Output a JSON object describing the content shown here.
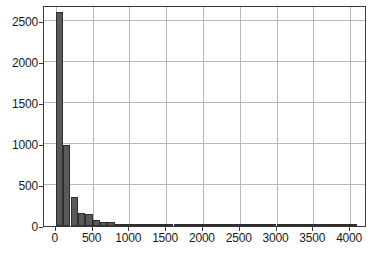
{
  "chart_data": {
    "type": "bar",
    "title": "",
    "subtitle": "",
    "xlabel": "",
    "ylabel": "",
    "xlim": [
      -160,
      4230
    ],
    "ylim": [
      0,
      2700
    ],
    "grid": true,
    "legend": null,
    "bin_width": 100,
    "xticks": [
      0,
      500,
      1000,
      1500,
      2000,
      2500,
      3000,
      3500,
      4000
    ],
    "xtick_labels": [
      "0",
      "500",
      "1000",
      "1500",
      "2000",
      "2500",
      "3000",
      "3500",
      "4000"
    ],
    "yticks": [
      0,
      500,
      1000,
      1500,
      2000,
      2500
    ],
    "ytick_labels": [
      "0",
      "500",
      "1000",
      "1500",
      "2000",
      "2500"
    ],
    "bar_color": "#595959",
    "bar_edge_color": "#2e2e2e",
    "grid_color": "#b9b9b9",
    "axis_color": "#3a3a3a",
    "bins": [
      {
        "x0": 0,
        "x1": 100,
        "value": 2620
      },
      {
        "x0": 100,
        "x1": 200,
        "value": 995
      },
      {
        "x0": 200,
        "x1": 300,
        "value": 350
      },
      {
        "x0": 300,
        "x1": 400,
        "value": 155
      },
      {
        "x0": 400,
        "x1": 500,
        "value": 150
      },
      {
        "x0": 500,
        "x1": 600,
        "value": 80
      },
      {
        "x0": 600,
        "x1": 700,
        "value": 55
      },
      {
        "x0": 700,
        "x1": 800,
        "value": 50
      },
      {
        "x0": 800,
        "x1": 900,
        "value": 22
      },
      {
        "x0": 900,
        "x1": 1000,
        "value": 12
      },
      {
        "x0": 1000,
        "x1": 1100,
        "value": 8
      },
      {
        "x0": 1100,
        "x1": 1200,
        "value": 6
      },
      {
        "x0": 1200,
        "x1": 1300,
        "value": 5
      },
      {
        "x0": 1300,
        "x1": 1400,
        "value": 5
      },
      {
        "x0": 1400,
        "x1": 1500,
        "value": 4
      },
      {
        "x0": 1500,
        "x1": 1600,
        "value": 4
      },
      {
        "x0": 1600,
        "x1": 1700,
        "value": 4
      },
      {
        "x0": 1700,
        "x1": 1800,
        "value": 4
      },
      {
        "x0": 1800,
        "x1": 1900,
        "value": 12
      },
      {
        "x0": 1900,
        "x1": 2000,
        "value": 4
      },
      {
        "x0": 2000,
        "x1": 2100,
        "value": 3
      },
      {
        "x0": 2100,
        "x1": 2200,
        "value": 18
      },
      {
        "x0": 2200,
        "x1": 2300,
        "value": 18
      },
      {
        "x0": 2300,
        "x1": 2400,
        "value": 3
      },
      {
        "x0": 2400,
        "x1": 2500,
        "value": 3
      },
      {
        "x0": 2500,
        "x1": 2600,
        "value": 2
      },
      {
        "x0": 2600,
        "x1": 2700,
        "value": 2
      },
      {
        "x0": 2700,
        "x1": 2800,
        "value": 2
      },
      {
        "x0": 2800,
        "x1": 2900,
        "value": 2
      },
      {
        "x0": 2900,
        "x1": 3000,
        "value": 2
      },
      {
        "x0": 3000,
        "x1": 3100,
        "value": 2
      },
      {
        "x0": 3100,
        "x1": 3200,
        "value": 2
      },
      {
        "x0": 3200,
        "x1": 3300,
        "value": 2
      },
      {
        "x0": 3300,
        "x1": 3400,
        "value": 2
      },
      {
        "x0": 3400,
        "x1": 3500,
        "value": 2
      },
      {
        "x0": 3500,
        "x1": 3600,
        "value": 2
      },
      {
        "x0": 3600,
        "x1": 3700,
        "value": 2
      },
      {
        "x0": 3700,
        "x1": 3800,
        "value": 2
      },
      {
        "x0": 3800,
        "x1": 3900,
        "value": 2
      },
      {
        "x0": 3900,
        "x1": 4000,
        "value": 2
      },
      {
        "x0": 4000,
        "x1": 4100,
        "value": 2
      }
    ]
  }
}
